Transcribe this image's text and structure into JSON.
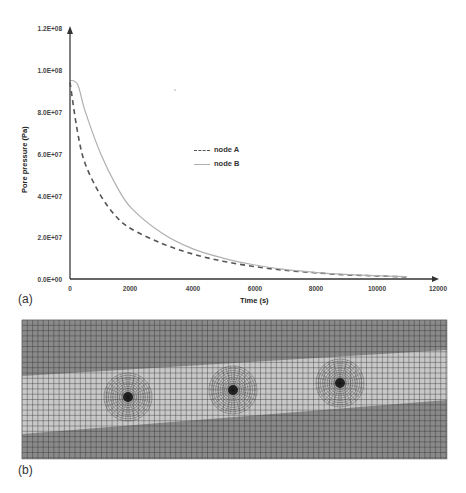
{
  "chart_data": {
    "type": "line",
    "title": "",
    "xlabel": "Time (s)",
    "ylabel": "Pore pressure (Pa)",
    "xlim": [
      0,
      12000
    ],
    "ylim": [
      0,
      120000000
    ],
    "x_ticks": [
      "0",
      "2000",
      "4000",
      "6000",
      "8000",
      "10000",
      "12000"
    ],
    "y_ticks": [
      "0.0E+00",
      "2.0E+07",
      "4.0E+07",
      "6.0E+07",
      "8.0E+07",
      "1.0E+08",
      "1.2E+08"
    ],
    "grid": false,
    "legend_position": "upper-center",
    "x": [
      0,
      250,
      500,
      1000,
      1500,
      2000,
      3000,
      4000,
      5000,
      6000,
      7000,
      8000,
      9000,
      10000,
      11000
    ],
    "series": [
      {
        "name": "node A",
        "style": "dashed",
        "color": "#555555",
        "values": [
          94000000,
          70000000,
          55000000,
          40000000,
          30000000,
          24000000,
          17000000,
          12000000,
          8500000,
          6000000,
          4200000,
          3000000,
          2000000,
          1500000,
          1000000
        ]
      },
      {
        "name": "node B",
        "style": "solid",
        "color": "#b0b0b0",
        "values": [
          95000000,
          93000000,
          80000000,
          60000000,
          45000000,
          34000000,
          22000000,
          14500000,
          10000000,
          6800000,
          4600000,
          3200000,
          2200000,
          1600000,
          1100000
        ]
      }
    ]
  },
  "panels": {
    "a_label": "(a)",
    "b_label": "(b)"
  },
  "legend": {
    "items": [
      {
        "label": "node A"
      },
      {
        "label": "node B"
      }
    ]
  },
  "mesh": {
    "description": "Finite element mesh of inclined layer with three refined nodes",
    "colors": {
      "outer": "#8a8a8a",
      "band": "#c8c8c8",
      "lines": "#2a2a2a"
    }
  }
}
